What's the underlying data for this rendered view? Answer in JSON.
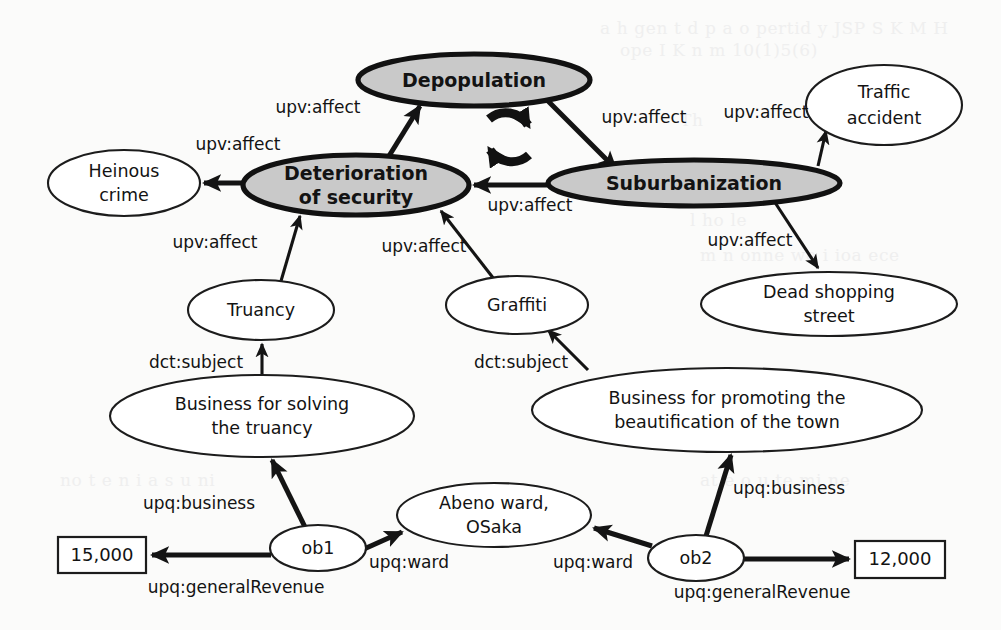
{
  "diagram": {
    "colors": {
      "highlight_fill": "#c9c9c9",
      "plain_fill": "#ffffff",
      "stroke": "#1c1c1c",
      "background": "#fbfbfa"
    },
    "nodes": [
      {
        "id": "depopulation",
        "label": "Depopulation",
        "kind": "highlight",
        "shape": "ellipse",
        "cx": 474,
        "cy": 80,
        "rx": 116,
        "ry": 26
      },
      {
        "id": "deterioration",
        "label": "Deterioration|of security",
        "kind": "highlight",
        "shape": "ellipse",
        "cx": 356,
        "cy": 185,
        "rx": 113,
        "ry": 30
      },
      {
        "id": "suburbanization",
        "label": "Suburbanization",
        "kind": "highlight",
        "shape": "ellipse",
        "cx": 694,
        "cy": 183,
        "rx": 146,
        "ry": 23
      },
      {
        "id": "heinous-crime",
        "label": "Heinous|crime",
        "kind": "plain",
        "shape": "ellipse",
        "cx": 124,
        "cy": 183,
        "rx": 76,
        "ry": 33
      },
      {
        "id": "traffic-accident",
        "label": "Traffic|accident",
        "kind": "plain",
        "shape": "ellipse",
        "cx": 884,
        "cy": 105,
        "rx": 78,
        "ry": 40
      },
      {
        "id": "truancy",
        "label": "Truancy",
        "kind": "plain",
        "shape": "ellipse",
        "cx": 261,
        "cy": 310,
        "rx": 73,
        "ry": 30
      },
      {
        "id": "graffiti",
        "label": "Graffiti",
        "kind": "plain",
        "shape": "ellipse",
        "cx": 517,
        "cy": 305,
        "rx": 71,
        "ry": 29
      },
      {
        "id": "dead-shopping",
        "label": "Dead shopping|street",
        "kind": "plain",
        "shape": "ellipse",
        "cx": 829,
        "cy": 304,
        "rx": 128,
        "ry": 32
      },
      {
        "id": "business-truancy",
        "label": "Business for solving|the truancy",
        "kind": "plain",
        "shape": "ellipse",
        "cx": 262,
        "cy": 416,
        "rx": 152,
        "ry": 41
      },
      {
        "id": "business-beautify",
        "label": "Business for promoting the|beautification of the town",
        "kind": "plain",
        "shape": "ellipse",
        "cx": 727,
        "cy": 410,
        "rx": 195,
        "ry": 42
      },
      {
        "id": "abeno-ward",
        "label": "Abeno ward,|OSaka",
        "kind": "plain",
        "shape": "ellipse",
        "cx": 494,
        "cy": 515,
        "rx": 97,
        "ry": 32
      },
      {
        "id": "ob1",
        "label": "ob1",
        "kind": "obj",
        "shape": "ellipse",
        "cx": 318,
        "cy": 548,
        "rx": 48,
        "ry": 23
      },
      {
        "id": "ob2",
        "label": "ob2",
        "kind": "obj",
        "shape": "ellipse",
        "cx": 696,
        "cy": 558,
        "rx": 48,
        "ry": 23
      },
      {
        "id": "revenue-15000",
        "label": "15,000",
        "kind": "value",
        "shape": "rect",
        "x": 58,
        "y": 537,
        "w": 88,
        "h": 36
      },
      {
        "id": "revenue-12000",
        "label": "12,000",
        "kind": "value",
        "shape": "rect",
        "x": 855,
        "y": 541,
        "w": 90,
        "h": 37
      }
    ],
    "edges": [
      {
        "id": "e1",
        "from": "deterioration",
        "to": "depopulation",
        "label": "upv:affect",
        "lx": 318,
        "ly": 108,
        "weight": "thick"
      },
      {
        "id": "e2",
        "from": "depopulation",
        "to": "suburbanization",
        "label": "upv:affect",
        "lx": 644,
        "ly": 118,
        "weight": "thick"
      },
      {
        "id": "e3",
        "from": "suburbanization",
        "to": "deterioration",
        "label": "upv:affect",
        "lx": 530,
        "ly": 206,
        "weight": "thick"
      },
      {
        "id": "e4",
        "from": "deterioration",
        "to": "heinous-crime",
        "label": "upv:affect",
        "lx": 238,
        "ly": 145,
        "weight": "thick"
      },
      {
        "id": "e5",
        "from": "suburbanization",
        "to": "traffic-accident",
        "label": "upv:affect",
        "lx": 766,
        "ly": 113,
        "weight": "thin"
      },
      {
        "id": "e6",
        "from": "suburbanization",
        "to": "dead-shopping",
        "label": "upv:affect",
        "lx": 750,
        "ly": 241,
        "weight": "thin"
      },
      {
        "id": "e7",
        "from": "truancy",
        "to": "deterioration",
        "label": "upv:affect",
        "lx": 215,
        "ly": 243,
        "weight": "thin"
      },
      {
        "id": "e8",
        "from": "graffiti",
        "to": "deterioration",
        "label": "upv:affect",
        "lx": 424,
        "ly": 247,
        "weight": "thin"
      },
      {
        "id": "e9",
        "from": "business-truancy",
        "to": "truancy",
        "label": "dct:subject",
        "lx": 196,
        "ly": 363,
        "weight": "thin"
      },
      {
        "id": "e10",
        "from": "business-beautify",
        "to": "graffiti",
        "label": "dct:subject",
        "lx": 521,
        "ly": 363,
        "weight": "thin"
      },
      {
        "id": "e11",
        "from": "ob1",
        "to": "business-truancy",
        "label": "upq:business",
        "lx": 199,
        "ly": 504,
        "weight": "thick"
      },
      {
        "id": "e12",
        "from": "ob1",
        "to": "abeno-ward",
        "label": "upq:ward",
        "lx": 409,
        "ly": 563,
        "weight": "thick"
      },
      {
        "id": "e13",
        "from": "ob1",
        "to": "revenue-15000",
        "label": "upq:generalRevenue",
        "lx": 236,
        "ly": 588,
        "weight": "thick"
      },
      {
        "id": "e14",
        "from": "ob2",
        "to": "business-beautify",
        "label": "upq:business",
        "lx": 789,
        "ly": 489,
        "weight": "thick"
      },
      {
        "id": "e15",
        "from": "ob2",
        "to": "abeno-ward",
        "label": "upq:ward",
        "lx": 593,
        "ly": 563,
        "weight": "thick"
      },
      {
        "id": "e16",
        "from": "ob2",
        "to": "revenue-12000",
        "label": "upq:generalRevenue",
        "lx": 762,
        "ly": 593,
        "weight": "thick"
      }
    ],
    "cycle_symbol": {
      "id": "cycle-icon",
      "cx": 508,
      "cy": 137,
      "r": 27,
      "meaning": "mutually-reinforcing-cycle"
    }
  }
}
